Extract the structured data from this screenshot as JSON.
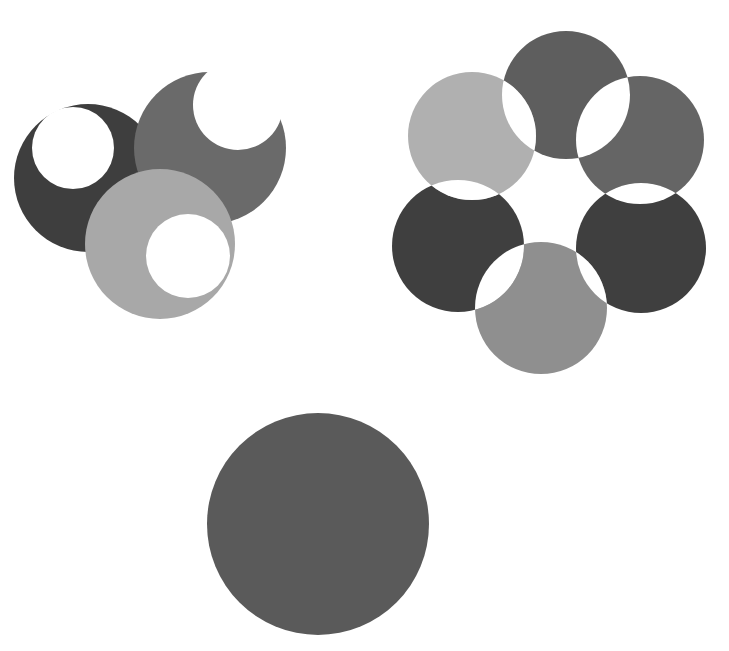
{
  "figure": {
    "width": 729,
    "height": 651,
    "background": "#ffffff",
    "groups": [
      {
        "name": "overlapping-crescents",
        "circles": [
          {
            "cx": 88,
            "cy": 178,
            "r": 74,
            "fill": "#3e3e3e",
            "hole": {
              "cx": 73,
              "cy": 148,
              "r": 41
            }
          },
          {
            "cx": 210,
            "cy": 148,
            "r": 76,
            "fill": "#6a6a6a",
            "hole": {
              "cx": 238,
              "cy": 105,
              "r": 45
            }
          },
          {
            "cx": 160,
            "cy": 244,
            "r": 75,
            "fill": "#a8a8a8",
            "hole": {
              "cx": 188,
              "cy": 256,
              "r": 42
            }
          }
        ]
      },
      {
        "name": "six-circle-flower",
        "circles": [
          {
            "cx": 566,
            "cy": 95,
            "r": 64,
            "fill": "#5e5e5e"
          },
          {
            "cx": 640,
            "cy": 140,
            "r": 64,
            "fill": "#656565"
          },
          {
            "cx": 641,
            "cy": 248,
            "r": 65,
            "fill": "#3f3f3f"
          },
          {
            "cx": 541,
            "cy": 308,
            "r": 66,
            "fill": "#8f8f8f"
          },
          {
            "cx": 458,
            "cy": 246,
            "r": 66,
            "fill": "#3f3f3f"
          },
          {
            "cx": 472,
            "cy": 136,
            "r": 64,
            "fill": "#b0b0b0"
          }
        ]
      },
      {
        "name": "single-circle",
        "circles": [
          {
            "cx": 318,
            "cy": 524,
            "r": 111,
            "fill": "#5a5a5a"
          }
        ]
      }
    ]
  }
}
